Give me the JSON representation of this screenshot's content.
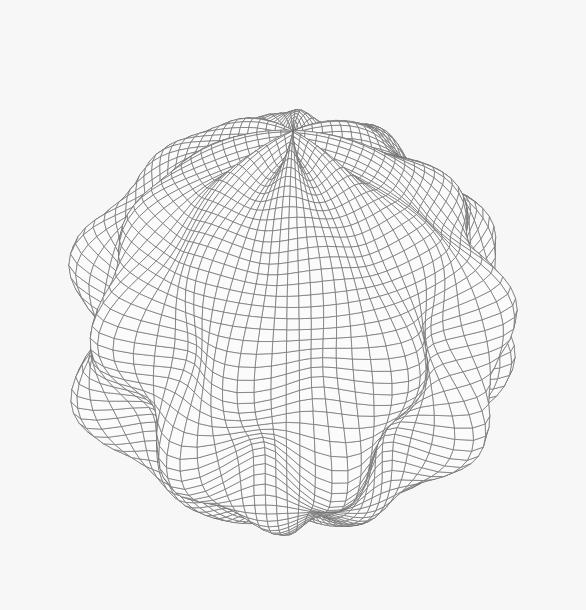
{
  "scene": {
    "subject": "wireframe spherical-harmonic bumpy sphere",
    "background_color": "#f7f7f7",
    "line_color": "#6f6f6f",
    "fill_color": "#fbfbfb",
    "center": [
      293,
      322
    ],
    "base_radius": 205,
    "bump_amplitude": 0.17,
    "bump_degree_phi": 8,
    "bump_degree_theta": 5,
    "lat_lines": 56,
    "lon_lines": 90,
    "tilt_deg": 28,
    "spin_deg": 12,
    "line_width": 0.7
  }
}
